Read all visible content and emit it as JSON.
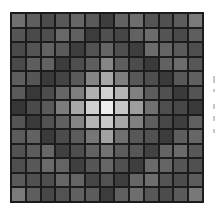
{
  "chart_data": {
    "type": "heatmap",
    "title": "",
    "xlabel": "",
    "ylabel": "",
    "rows": 13,
    "cols": 13,
    "colormap": "grayscale",
    "legend": "none",
    "grid": true,
    "values": [
      [
        112,
        94,
        76,
        88,
        102,
        90,
        62,
        98,
        110,
        84,
        80,
        92,
        122
      ],
      [
        86,
        74,
        78,
        104,
        96,
        60,
        80,
        70,
        98,
        108,
        84,
        74,
        94
      ],
      [
        74,
        84,
        98,
        90,
        62,
        82,
        100,
        78,
        62,
        108,
        100,
        90,
        78
      ],
      [
        74,
        94,
        98,
        60,
        78,
        94,
        134,
        94,
        76,
        58,
        98,
        108,
        86
      ],
      [
        94,
        86,
        58,
        68,
        90,
        132,
        168,
        126,
        88,
        78,
        58,
        88,
        96
      ],
      [
        90,
        56,
        76,
        102,
        126,
        176,
        210,
        180,
        128,
        92,
        80,
        58,
        84
      ],
      [
        54,
        74,
        90,
        124,
        168,
        208,
        238,
        198,
        158,
        112,
        78,
        72,
        58
      ],
      [
        84,
        58,
        82,
        96,
        132,
        180,
        200,
        166,
        128,
        94,
        72,
        62,
        96
      ],
      [
        92,
        98,
        58,
        76,
        92,
        118,
        162,
        112,
        88,
        82,
        60,
        94,
        102
      ],
      [
        82,
        92,
        102,
        64,
        78,
        98,
        114,
        92,
        86,
        66,
        100,
        106,
        88
      ],
      [
        78,
        88,
        106,
        100,
        64,
        86,
        102,
        80,
        62,
        106,
        100,
        86,
        80
      ],
      [
        90,
        80,
        78,
        102,
        100,
        70,
        82,
        62,
        102,
        110,
        84,
        76,
        92
      ],
      [
        122,
        94,
        72,
        82,
        96,
        92,
        60,
        96,
        110,
        88,
        76,
        90,
        120
      ]
    ],
    "value_range": [
      0,
      255
    ],
    "note": "Grayscale intensity per cell; bright peak at center (row 6, col 6)"
  },
  "side_marks": [
    {
      "top": 76,
      "height": 7
    },
    {
      "top": 89,
      "height": 3
    },
    {
      "top": 104,
      "height": 5
    },
    {
      "top": 116,
      "height": 5
    },
    {
      "top": 129,
      "height": 4
    }
  ]
}
